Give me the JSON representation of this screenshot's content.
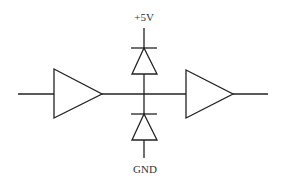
{
  "diagram": {
    "type": "circuit-schematic",
    "labels": {
      "supply": "+5V",
      "ground": "GND"
    },
    "components": [
      {
        "id": "buffer-1",
        "kind": "buffer",
        "label": ""
      },
      {
        "id": "buffer-2",
        "kind": "buffer",
        "label": ""
      },
      {
        "id": "diode-top",
        "kind": "diode",
        "connects": [
          "node",
          "+5V"
        ]
      },
      {
        "id": "diode-bottom",
        "kind": "diode",
        "connects": [
          "GND",
          "node"
        ]
      }
    ],
    "colors": {
      "stroke": "#222222",
      "text": "#333333",
      "background": "#ffffff"
    }
  }
}
